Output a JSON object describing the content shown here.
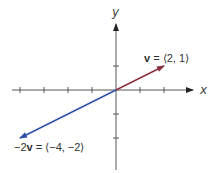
{
  "diagram": {
    "axes": {
      "x_label": "x",
      "y_label": "y",
      "origin_px": [
        116,
        90
      ],
      "unit_px": 24,
      "x_ticks": [
        -4,
        -3,
        -2,
        -1,
        1,
        2
      ],
      "y_ticks": [
        1,
        -1,
        -2
      ],
      "color": "#555555"
    },
    "vectors": [
      {
        "name": "v",
        "components": [
          2,
          1
        ],
        "color": "#8a2f3c",
        "label": {
          "prefix": "",
          "bold": "v",
          "rest": " = ⟨2, 1⟩"
        }
      },
      {
        "name": "-2v",
        "components": [
          -4,
          -2
        ],
        "color": "#2e4fa8",
        "label": {
          "prefix": "−2",
          "bold": "v",
          "rest": " = ⟨−4, −2⟩"
        }
      }
    ]
  }
}
